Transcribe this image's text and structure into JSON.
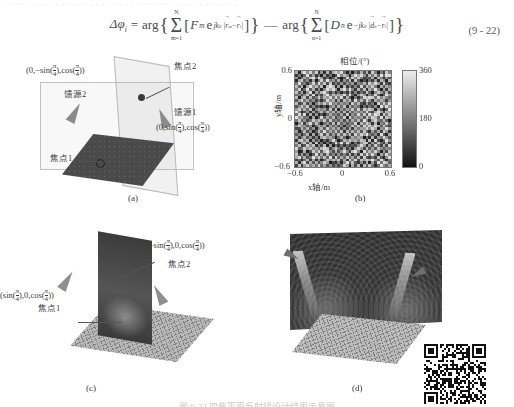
{
  "document": {
    "top_running_text": "· · · · · · · · · · · · · · · · · · · · · · · · · · · · · · · · · · · · · · · · ·",
    "equation_number": "(9 - 22)",
    "figure_caption": "图 9-22  双焦平面反射镜设计结果示意图"
  },
  "equation": {
    "lhs": "Δφ",
    "lhs_sub": "i",
    "eq": "=",
    "arg1": "arg",
    "arg2": "arg",
    "minus": "—",
    "sum_top": "N",
    "sum_bot1": "m=1",
    "sum_bot2": "n=1",
    "term1_coef": "F",
    "term1_coef_sub": "m",
    "term1_e": "e",
    "term1_exp_sign": "jk",
    "term1_exp_sub": "0",
    "term1_vec1": "r",
    "term1_vec1_sub": "m",
    "term1_minus": "−",
    "term1_vec2": "r",
    "term1_vec2_sub": "i",
    "term2_coef": "D",
    "term2_coef_sub": "n",
    "term2_e": "e",
    "term2_exp_sign": "−jk",
    "term2_exp_sub": "0",
    "term2_vec1": "d",
    "term2_vec1_sub": "n",
    "term2_minus": "−",
    "term2_vec2": "r",
    "term2_vec2_sub": "i",
    "bar": "|",
    "lbrace": "{",
    "rbrace": "}",
    "lbrack": "[",
    "rbrack": "]",
    "sigma": "Σ"
  },
  "panels": {
    "a": {
      "caption": "(a)",
      "label_focus2_coord": {
        "pre": "(0,−sin(",
        "num": "π",
        "den": "4",
        "mid": "),cos(",
        "num2": "π",
        "den2": "4",
        "post": "))"
      },
      "label_focus2_name": "焦点2",
      "label_feed2": "馈源2",
      "label_feed1": "馈源1",
      "label_feed1_coord": {
        "pre": "(0,sin(",
        "num": "π",
        "den": "4",
        "mid": "),cos(",
        "num2": "π",
        "den2": "4",
        "post": "))"
      },
      "label_focus1_name": "焦点1"
    },
    "b": {
      "caption": "(b)",
      "colorbar_title": "相位/(°)",
      "x_label": "x轴/m",
      "y_label": "y轴/m",
      "x_ticks": [
        "−0.6",
        "0",
        "0.6"
      ],
      "y_ticks": [
        "0.6",
        "0",
        "−0.6"
      ],
      "colorbar_ticks": [
        "360",
        "180",
        "0"
      ]
    },
    "c": {
      "caption": "(c)",
      "label_focus2_coord": {
        "pre": "(−sin(",
        "num": "π",
        "den": "4",
        "mid": "),0,cos(",
        "num2": "π",
        "den2": "4",
        "post": "))"
      },
      "label_focus2_name": "焦点2",
      "label_focus1_coord": {
        "pre": "(sin(",
        "num": "π",
        "den": "4",
        "mid": "),0,cos(",
        "num2": "π",
        "den2": "4",
        "post": "))"
      },
      "label_focus1_name": "焦点1"
    },
    "d": {
      "caption": "(d)"
    }
  },
  "chart_data": {
    "type": "heatmap",
    "title": "相位/(°)",
    "xlabel": "x轴/m",
    "ylabel": "y轴/m",
    "xlim": [
      -0.6,
      0.6
    ],
    "ylim": [
      -0.6,
      0.6
    ],
    "zlim": [
      0,
      360
    ],
    "colormap": "gray",
    "grid": false,
    "legend_position": "right-colorbar",
    "cells": 34
  }
}
